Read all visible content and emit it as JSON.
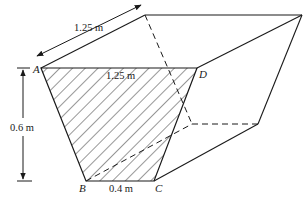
{
  "figure": {
    "colors": {
      "line": "#1a1a1a",
      "background": "#ffffff"
    },
    "vertices": {
      "A": "A",
      "B": "B",
      "C": "C",
      "D": "D"
    },
    "dimensions": {
      "length": "1.25 m",
      "top_width": "1.25 m",
      "depth": "0.6 m",
      "bottom_width": "0.4 m"
    }
  }
}
